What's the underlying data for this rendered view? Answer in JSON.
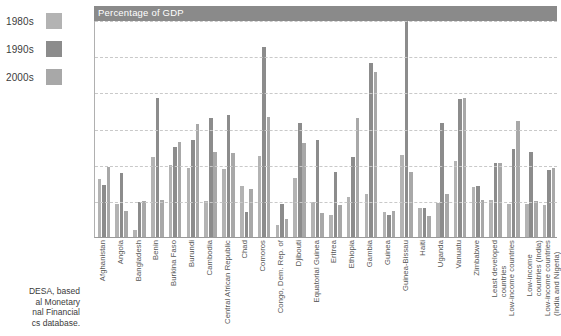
{
  "legend": {
    "items": [
      {
        "label": "1980s",
        "color": "#b3b3b3"
      },
      {
        "label": "1990s",
        "color": "#8c8c8c"
      },
      {
        "label": "2000s",
        "color": "#a8a8a8"
      }
    ]
  },
  "source": {
    "lines": [
      "DESA, based",
      "al Monetary",
      "nal Financial",
      "cs database."
    ]
  },
  "chart_data": {
    "type": "bar",
    "title": "Percentage of GDP",
    "xlabel": "",
    "ylabel": "",
    "ylim": [
      0,
      30
    ],
    "yticks": [
      0,
      5,
      10,
      15,
      20,
      25,
      30
    ],
    "grid": true,
    "legend_position": "left-outside",
    "clip_note": "Guinea-Bissau 1990s bar is clipped at the top of the plot area",
    "categories": [
      "Afghanistan",
      "Angola",
      "Bangladesh",
      "Benin",
      "Burkina Faso",
      "Burundi",
      "Cambodia",
      "Central African Republic",
      "Chad",
      "Comoros",
      "Congo, Dem. Rep. of",
      "Djibouti",
      "Equatorial Guinea",
      "Eritrea",
      "Ethiopia",
      "Gambia",
      "Guinea",
      "Guinea-Bissau",
      "Haiti",
      "Uganda",
      "Vanuatu",
      "Zimbabwe",
      "Least developed\ncountries",
      "Low-income countries",
      "Low-income\ncountries (India)",
      "Low-income countries\n(India and Nigeria)"
    ],
    "series": [
      {
        "name": "1980s",
        "color": "#b3b3b3",
        "values": [
          8.0,
          4.6,
          1.0,
          11.0,
          10.0,
          9.6,
          5.0,
          9.4,
          7.1,
          11.2,
          1.6,
          8.2,
          4.9,
          3.0,
          5.5,
          6.0,
          3.4,
          11.4,
          4.0,
          4.7,
          10.5,
          6.9,
          5.1,
          4.5,
          4.5,
          4.4
        ]
      },
      {
        "name": "1990s",
        "color": "#8c8c8c",
        "values": [
          7.2,
          8.9,
          4.8,
          19.2,
          12.5,
          13.4,
          16.5,
          16.9,
          3.5,
          26.3,
          4.5,
          15.8,
          13.4,
          9.0,
          11.0,
          24.0,
          3.1,
          33.0,
          4.0,
          15.8,
          19.1,
          7.1,
          10.3,
          12.2,
          11.7,
          9.3
        ]
      },
      {
        "name": "2000s",
        "color": "#a8a8a8",
        "values": [
          9.7,
          3.6,
          5.0,
          5.1,
          13.1,
          15.6,
          11.8,
          11.6,
          6.6,
          16.6,
          2.5,
          13.0,
          3.3,
          4.4,
          16.5,
          22.8,
          3.6,
          9.0,
          2.9,
          5.9,
          19.2,
          5.1,
          10.2,
          16.1,
          5.0,
          9.6
        ]
      }
    ]
  }
}
